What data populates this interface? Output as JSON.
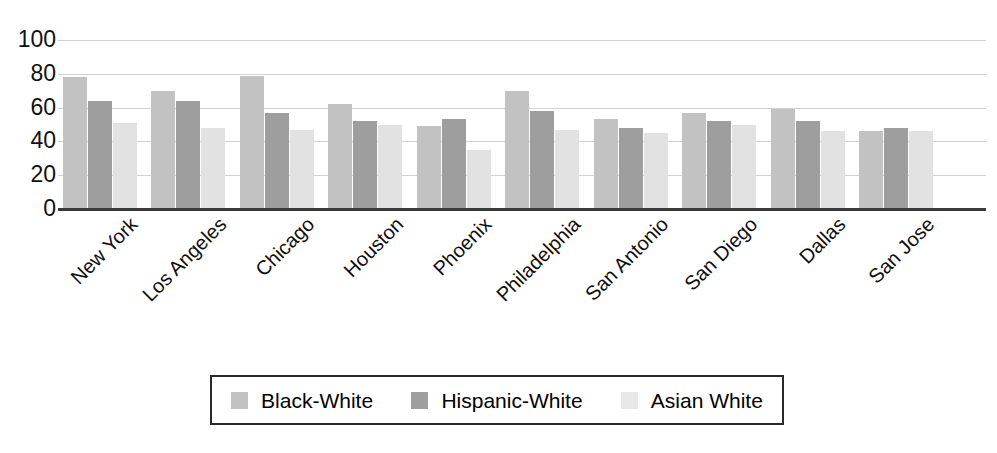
{
  "chart_data": {
    "type": "bar",
    "title": "",
    "subtitle": "",
    "xlabel": "",
    "ylabel": "",
    "ylim": [
      0,
      100
    ],
    "yticks": [
      0,
      20,
      40,
      60,
      80,
      100
    ],
    "grid": true,
    "legend_position": "bottom",
    "categories": [
      "New York",
      "Los Angeles",
      "Chicago",
      "Houston",
      "Phoenix",
      "Philadelphia",
      "San Antonio",
      "San Diego",
      "Dallas",
      "San Jose"
    ],
    "series": [
      {
        "name": "Black-White",
        "color": "#c2c2c2",
        "values": [
          78,
          70,
          79,
          62,
          49,
          70,
          53,
          57,
          59,
          46
        ]
      },
      {
        "name": "Hispanic-White",
        "color": "#9e9e9e",
        "values": [
          64,
          64,
          57,
          52,
          53,
          58,
          48,
          52,
          52,
          48
        ]
      },
      {
        "name": "Asian White",
        "color": "#e2e2e2",
        "values": [
          51,
          48,
          47,
          50,
          35,
          47,
          45,
          50,
          46,
          46
        ]
      }
    ]
  },
  "axis": {
    "ytick_labels": [
      "100",
      "80",
      "60",
      "40",
      "20",
      "0"
    ]
  },
  "legend": {
    "items": [
      {
        "label": "Black-White",
        "swatch": "#c2c2c2"
      },
      {
        "label": "Hispanic-White",
        "swatch": "#9e9e9e"
      },
      {
        "label": "Asian White",
        "swatch": "#e8e8e8"
      }
    ]
  }
}
